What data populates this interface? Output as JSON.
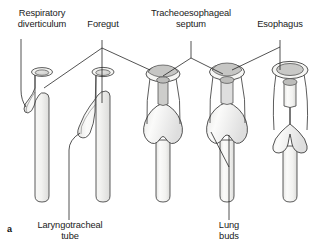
{
  "figure": {
    "panel_letter": "a",
    "kind": "embryology-diagram"
  },
  "labels": {
    "respiratory_diverticulum": "Respiratory\ndiverticulum",
    "foregut": "Foregut",
    "tracheoesophageal_septum": "Tracheoesophageal\nseptum",
    "esophagus": "Esophagus",
    "laryngotracheal_tube": "Laryngotracheal\ntube",
    "lung_buds": "Lung\nbuds"
  },
  "stages": [
    {
      "index": 1,
      "name": "stage-1-respiratory-diverticulum"
    },
    {
      "index": 2,
      "name": "stage-2-laryngotracheal-tube"
    },
    {
      "index": 3,
      "name": "stage-3-septum-forming"
    },
    {
      "index": 4,
      "name": "stage-4-septum-advancing"
    },
    {
      "index": 5,
      "name": "stage-5-separated"
    }
  ],
  "colors": {
    "outline": "#3a3a3a",
    "fill": "#f4f4f2",
    "lumen_fill": "#d8d8d6",
    "septum_fill": "#c9c9c7",
    "shadow": "#e3e3e1",
    "leader": "#1a1a1a",
    "text": "#1a1a1a",
    "background": "#ffffff"
  }
}
